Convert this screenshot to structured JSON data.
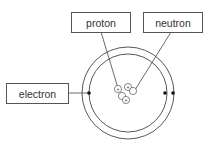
{
  "labels": {
    "proton": "proton",
    "neutron": "neutron",
    "electron": "electron"
  },
  "nucleus": {
    "particles": [
      {
        "type": "proton",
        "symbol": "+"
      },
      {
        "type": "proton",
        "symbol": "+"
      },
      {
        "type": "neutron",
        "symbol": ""
      },
      {
        "type": "neutron",
        "symbol": ""
      },
      {
        "type": "proton",
        "symbol": "+"
      }
    ]
  },
  "shells": [
    {
      "electrons": 2
    },
    {
      "electrons": 1
    }
  ],
  "colors": {
    "line": "#444444",
    "electron": "#111111"
  }
}
